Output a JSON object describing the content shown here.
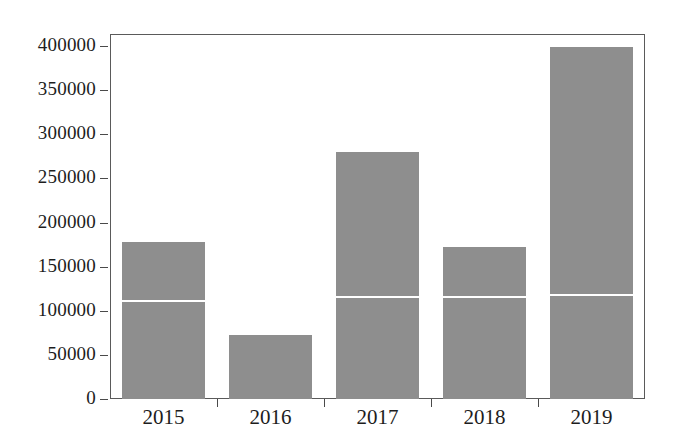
{
  "chart_data": {
    "type": "bar",
    "title": "",
    "subtitle": "",
    "xlabel": "",
    "ylabel": "",
    "categories": [
      "2015",
      "2016",
      "2017",
      "2018",
      "2019"
    ],
    "values": [
      178000,
      72000,
      280000,
      172000,
      399000
    ],
    "series": [
      {
        "name": "lower segment",
        "values": [
          110000,
          72000,
          114000,
          114000,
          117000
        ]
      },
      {
        "name": "upper segment",
        "values": [
          68000,
          0,
          166000,
          58000,
          282000
        ]
      }
    ],
    "ylim": [
      0,
      400000
    ],
    "xlim": [
      0,
      5
    ],
    "y_ticks": [
      0,
      50000,
      100000,
      150000,
      200000,
      250000,
      300000,
      350000,
      400000
    ],
    "y_tick_labels": [
      "0",
      "50000",
      "100000",
      "150000",
      "200000",
      "250000",
      "300000",
      "350000",
      "400000"
    ],
    "x_tick_labels": [
      "2015",
      "2016",
      "2017",
      "2018",
      "2019"
    ],
    "grid": false,
    "legend": "none",
    "bar_color": "#8e8e8e",
    "divider_color": "#ffffff",
    "axis_color": "#5a5a5a",
    "background": "#ffffff"
  }
}
